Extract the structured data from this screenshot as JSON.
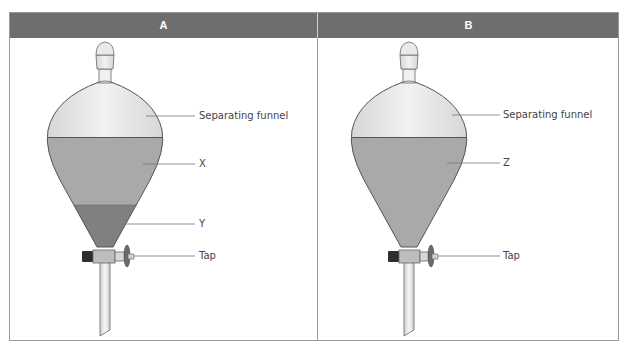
{
  "panels": [
    {
      "id": "A",
      "title": "A",
      "labels": {
        "funnel": "Separating funnel",
        "upper_layer": "X",
        "lower_layer": "Y",
        "tap": "Tap"
      },
      "layers": [
        "X",
        "Y"
      ]
    },
    {
      "id": "B",
      "title": "B",
      "labels": {
        "funnel": "Separating funnel",
        "single_layer": "Z",
        "tap": "Tap"
      },
      "layers": [
        "Z"
      ]
    }
  ],
  "colors": {
    "header_bg": "#6e6e6e",
    "header_text": "#ffffff",
    "glass": "#e4e4e4",
    "liquid_light": "#a9a9a9",
    "liquid_dark": "#808080",
    "outline": "#555555",
    "leader_line": "#777777"
  }
}
